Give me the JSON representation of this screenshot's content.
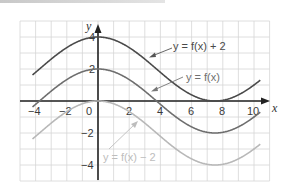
{
  "chart_data": {
    "type": "line",
    "title": "",
    "xlabel": "x",
    "ylabel": "y",
    "xlim": [
      -5,
      11
    ],
    "ylim": [
      -5,
      5
    ],
    "grid": true,
    "x_ticks": [
      -4,
      -2,
      0,
      2,
      4,
      6,
      8,
      10
    ],
    "x_tick_labels": [
      "−4",
      "−2",
      "0",
      "2",
      "4",
      "6",
      "8",
      "10"
    ],
    "y_ticks": [
      4,
      2,
      -2,
      -4
    ],
    "y_tick_labels": [
      "4",
      "2",
      "−2",
      "−4"
    ],
    "function": "f(x) ≈ 2cos(2πx/15)",
    "x": [
      -4.2,
      -4,
      -2,
      0,
      2,
      4,
      6,
      7.5,
      8,
      10,
      10.4
    ],
    "series": [
      {
        "name": "y = f(x) + 2",
        "color": "#4a4a4a",
        "shift": 2,
        "values": [
          1.7,
          2.2,
          3.34,
          4,
          3.34,
          2.2,
          0.86,
          0,
          0.04,
          1.0,
          2.4
        ]
      },
      {
        "name": "y = f(x)",
        "color": "#6e6e6e",
        "shift": 0,
        "values": [
          -0.3,
          0.2,
          1.34,
          2,
          1.34,
          0.2,
          -1.14,
          -2,
          -1.96,
          -1.0,
          0.4
        ]
      },
      {
        "name": "y = f(x) − 2",
        "color": "#b8b8b8",
        "shift": -2,
        "values": [
          -2.3,
          -1.8,
          -0.66,
          0,
          -0.66,
          -1.8,
          -3.14,
          -4,
          -3.96,
          -3.0,
          -1.6
        ]
      }
    ],
    "annotations": [
      {
        "text": "y = f(x) + 2",
        "points_to": "upper curve"
      },
      {
        "text": "y = f(x)",
        "points_to": "middle curve"
      },
      {
        "text": "y = f(x) − 2",
        "points_to": "lower curve"
      }
    ]
  },
  "labels": {
    "x_axis": "x",
    "y_axis": "y",
    "upper": "y = f(x) + 2",
    "middle": "y = f(x)",
    "lower": "y = f(x) − 2"
  },
  "ticks": {
    "x": [
      "−4",
      "−2",
      "0",
      "2",
      "4",
      "6",
      "8",
      "10"
    ],
    "y": [
      "4",
      "2",
      "−2",
      "−4"
    ]
  }
}
